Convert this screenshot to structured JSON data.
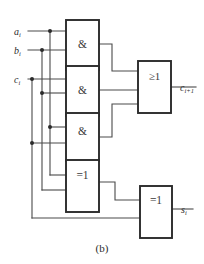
{
  "figure": {
    "caption": "(b)",
    "top_cut_text": "",
    "colors": {
      "wire": "#4a4a4a",
      "gate_border": "#2b2b2b",
      "background": "#ffffff",
      "label": "#2b2b2b"
    }
  },
  "inputs": [
    {
      "id": "a",
      "base": "a",
      "sub": "i",
      "label": "a i"
    },
    {
      "id": "b",
      "base": "b",
      "sub": "i",
      "label": "b i"
    },
    {
      "id": "c",
      "base": "c",
      "sub": "i",
      "label": "c i"
    }
  ],
  "outputs": [
    {
      "id": "carry",
      "base": "c",
      "sub": "i+1",
      "label": "c i+1"
    },
    {
      "id": "sum",
      "base": "s",
      "sub": "i",
      "label": "s i"
    }
  ],
  "gates": [
    {
      "id": "and1",
      "symbol": "&",
      "type": "and",
      "name": "and-gate-1"
    },
    {
      "id": "and2",
      "symbol": "&",
      "type": "and",
      "name": "and-gate-2"
    },
    {
      "id": "and3",
      "symbol": "&",
      "type": "and",
      "name": "and-gate-3"
    },
    {
      "id": "or1",
      "symbol": "≥1",
      "type": "or",
      "name": "or-gate"
    },
    {
      "id": "xor1",
      "symbol": "=1",
      "type": "xor",
      "name": "xor-gate-1"
    },
    {
      "id": "xor2",
      "symbol": "=1",
      "type": "xor",
      "name": "xor-gate-2"
    }
  ]
}
